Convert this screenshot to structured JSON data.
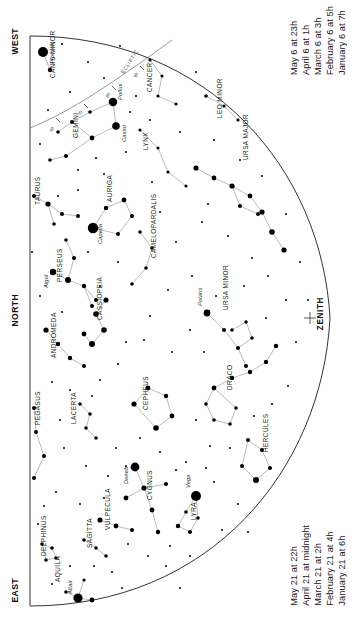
{
  "chart": {
    "type": "star-chart",
    "zenith_label": "ZENITH",
    "compass": {
      "west": "WEST",
      "north": "NORTH",
      "east": "EAST"
    }
  },
  "dates_top": [
    {
      "date": "January 6 at",
      "time": "7h"
    },
    {
      "date": "February 6 at",
      "time": "5h"
    },
    {
      "date": "March 6 at",
      "time": "3h"
    },
    {
      "date": "April 6 at",
      "time": "1h"
    },
    {
      "date": "May 6 at 23h",
      "time": ""
    }
  ],
  "dates_bottom": [
    {
      "date": "January 21 at",
      "time": "6h"
    },
    {
      "date": "February 21 at",
      "time": "4h"
    },
    {
      "date": "March 21 at",
      "time": "2h"
    },
    {
      "date": "April 21 at midnight",
      "time": ""
    },
    {
      "date": "May 21 at",
      "time": "22h"
    }
  ],
  "ecliptic_label": "ECLIPTIC",
  "constellations": [
    {
      "name": "CANIS MINOR",
      "x": 55,
      "y": 78,
      "rot": -90
    },
    {
      "name": "GEMINI",
      "x": 78,
      "y": 138,
      "rot": -90
    },
    {
      "name": "CANCER",
      "x": 152,
      "y": 92,
      "rot": -90
    },
    {
      "name": "LYNX",
      "x": 148,
      "y": 150,
      "rot": -90
    },
    {
      "name": "LEO MINOR",
      "x": 222,
      "y": 118,
      "rot": -90
    },
    {
      "name": "URSA MAJOR",
      "x": 248,
      "y": 160,
      "rot": -90
    },
    {
      "name": "TAURUS",
      "x": 40,
      "y": 205,
      "rot": -90
    },
    {
      "name": "AURIGA",
      "x": 112,
      "y": 202,
      "rot": -90
    },
    {
      "name": "PERSEUS",
      "x": 62,
      "y": 282,
      "rot": -90
    },
    {
      "name": "CAMELOPARDALIS",
      "x": 156,
      "y": 258,
      "rot": -90
    },
    {
      "name": "URSA MINOR",
      "x": 228,
      "y": 310,
      "rot": -90
    },
    {
      "name": "CASSIOPEIA",
      "x": 102,
      "y": 320,
      "rot": -90
    },
    {
      "name": "ANDROMEDA",
      "x": 56,
      "y": 358,
      "rot": -90
    },
    {
      "name": "CEPHEUS",
      "x": 148,
      "y": 410,
      "rot": -90
    },
    {
      "name": "DRACO",
      "x": 232,
      "y": 390,
      "rot": -90
    },
    {
      "name": "HERCULES",
      "x": 268,
      "y": 452,
      "rot": -90
    },
    {
      "name": "PEGASUS",
      "x": 40,
      "y": 425,
      "rot": -90
    },
    {
      "name": "LACERTA",
      "x": 76,
      "y": 424,
      "rot": -90
    },
    {
      "name": "CYGNUS",
      "x": 152,
      "y": 500,
      "rot": -90
    },
    {
      "name": "LYRA",
      "x": 196,
      "y": 520,
      "rot": -90
    },
    {
      "name": "VULPECULA",
      "x": 110,
      "y": 530,
      "rot": -90
    },
    {
      "name": "SAGITTA",
      "x": 92,
      "y": 548,
      "rot": -90
    },
    {
      "name": "DELPHINUS",
      "x": 46,
      "y": 556,
      "rot": -90
    },
    {
      "name": "AQUILA",
      "x": 60,
      "y": 582,
      "rot": -90
    }
  ],
  "named_stars": [
    {
      "name": "Procyon",
      "x": 43,
      "y": 52,
      "mag": 0.4
    },
    {
      "name": "Pollux",
      "x": 113,
      "y": 102,
      "mag": 1.2
    },
    {
      "name": "Castor",
      "x": 116,
      "y": 126,
      "mag": 1.6
    },
    {
      "name": "Capella",
      "x": 93,
      "y": 228,
      "mag": 0.1
    },
    {
      "name": "Algol",
      "x": 53,
      "y": 272,
      "mag": 2.1
    },
    {
      "name": "Polaris",
      "x": 207,
      "y": 313,
      "mag": 2.0
    },
    {
      "name": "Deneb",
      "x": 135,
      "y": 467,
      "mag": 1.3
    },
    {
      "name": "Vega",
      "x": 196,
      "y": 496,
      "mag": 0.0
    },
    {
      "name": "Altair",
      "x": 78,
      "y": 598,
      "mag": 0.8
    }
  ],
  "ecliptic_ticks": [
    "60",
    "70",
    "80",
    "90"
  ]
}
